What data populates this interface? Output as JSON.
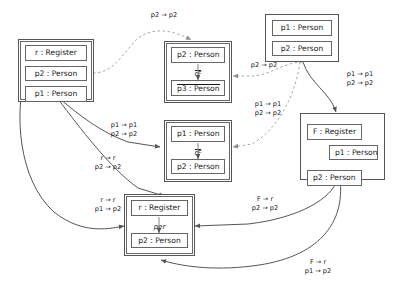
{
  "diagram": {
    "groups": [
      {
        "id": "g-left-register",
        "name": "left-register-group",
        "nodes": [
          {
            "label": "r : Register"
          },
          {
            "label": "p2 : Person"
          },
          {
            "label": "p1 : Person"
          }
        ]
      },
      {
        "id": "g-mid-top",
        "name": "mid-top-person-group",
        "nodes": [
          {
            "label": "p2 : Person"
          },
          {
            "label": "p3 : Person"
          }
        ],
        "inner_label": "rF"
      },
      {
        "id": "g-mid-bottom",
        "name": "mid-bottom-person-group",
        "nodes": [
          {
            "label": "p1 : Person"
          },
          {
            "label": "p2 : Person"
          }
        ],
        "inner_label": "rF"
      },
      {
        "id": "g-top-right",
        "name": "top-right-person-group",
        "nodes": [
          {
            "label": "p1 : Person"
          },
          {
            "label": "p2 : Person"
          }
        ]
      },
      {
        "id": "g-right-register",
        "name": "right-register-group",
        "nodes": [
          {
            "label": "F : Register"
          },
          {
            "label": "p1 : Person"
          },
          {
            "label": "p2 : Person"
          }
        ]
      },
      {
        "id": "g-bottom-register",
        "name": "bottom-register-group",
        "nodes": [
          {
            "label": "r : Register"
          },
          {
            "label": "p2 : Person"
          }
        ],
        "inner_label": "per"
      }
    ],
    "edge_labels": [
      {
        "id": "el-top-dashed",
        "line1": "p2 → p2",
        "line2": ""
      },
      {
        "id": "el-mid-dashed",
        "line1": "p2 → p2",
        "line2": ""
      },
      {
        "id": "el-left-to-mid",
        "line1": "p1 → p1",
        "line2": "p2 → p2"
      },
      {
        "id": "el-center-dashed",
        "line1": "p1 → p1",
        "line2": "p2 → p2"
      },
      {
        "id": "el-right-down",
        "line1": "p1 → p1",
        "line2": "p2 → p2"
      },
      {
        "id": "el-left-to-bottom-a",
        "line1": "r → r",
        "line2": "p2 → p2"
      },
      {
        "id": "el-left-to-bottom-b",
        "line1": "r → r",
        "line2": "p1 → p2"
      },
      {
        "id": "el-right-to-bottom-a",
        "line1": "F → r",
        "line2": "p2 → p2"
      },
      {
        "id": "el-right-to-bottom-b",
        "line1": "F → r",
        "line2": "p1 → p2"
      }
    ],
    "colors": {
      "stroke": "#555555",
      "dashed_stroke": "#a8a8a8",
      "background": "#ffffff",
      "text": "#1a1a1a"
    }
  }
}
